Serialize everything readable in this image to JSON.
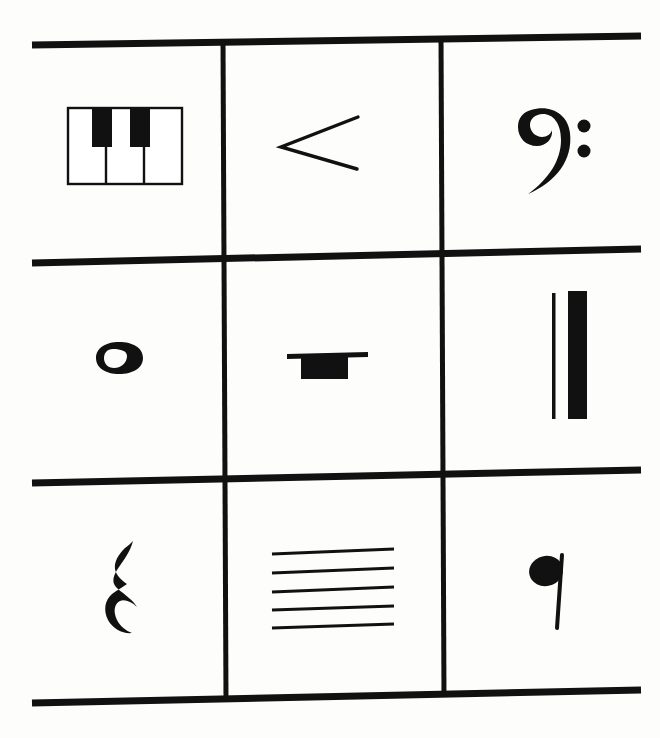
{
  "page": {
    "background_color": "#fdfdfb",
    "ink_color": "#111111",
    "width": 660,
    "height": 738
  },
  "grid": {
    "rows": 3,
    "columns": 3,
    "line_color": "#111111",
    "horizontal_rules": [
      {
        "name": "top-rule",
        "x1": 32,
        "y1": 45,
        "x2": 641,
        "y2": 36,
        "thickness": 7
      },
      {
        "name": "rule-row1-2",
        "x1": 32,
        "y1": 263,
        "x2": 641,
        "y2": 249,
        "thickness": 7
      },
      {
        "name": "rule-row2-3",
        "x1": 32,
        "y1": 483,
        "x2": 641,
        "y2": 470,
        "thickness": 7
      },
      {
        "name": "bottom-rule",
        "x1": 32,
        "y1": 703,
        "x2": 641,
        "y2": 690,
        "thickness": 7
      }
    ],
    "vertical_rules": [
      {
        "name": "column-divider-left",
        "x1": 223,
        "y1": 41,
        "x2": 226,
        "y2": 700,
        "thickness": 5
      },
      {
        "name": "column-divider-right",
        "x1": 441,
        "y1": 38,
        "x2": 444,
        "y2": 697,
        "thickness": 5
      }
    ]
  },
  "cells": [
    {
      "id": "cell-r1c1",
      "row": 1,
      "column": 1,
      "symbol_name": "piano-keyboard-icon",
      "label": "Piano keyboard",
      "white_keys": 3,
      "black_keys": 2
    },
    {
      "id": "cell-r1c2",
      "row": 1,
      "column": 2,
      "symbol_name": "crescendo-hairpin-icon",
      "label": "Crescendo hairpin",
      "glyph": "<"
    },
    {
      "id": "cell-r1c3",
      "row": 1,
      "column": 3,
      "symbol_name": "bass-clef-icon",
      "label": "Bass clef",
      "glyph": "𝄢"
    },
    {
      "id": "cell-r2c1",
      "row": 2,
      "column": 1,
      "symbol_name": "whole-note-icon",
      "label": "Whole note",
      "glyph": "𝅝"
    },
    {
      "id": "cell-r2c2",
      "row": 2,
      "column": 2,
      "symbol_name": "whole-rest-icon",
      "label": "Whole rest",
      "glyph": "𝄻"
    },
    {
      "id": "cell-r2c3",
      "row": 2,
      "column": 3,
      "symbol_name": "final-barline-icon",
      "label": "Final barline",
      "glyph": "𝄂"
    },
    {
      "id": "cell-r3c1",
      "row": 3,
      "column": 1,
      "symbol_name": "quarter-rest-icon",
      "label": "Quarter rest",
      "glyph": "𝄽"
    },
    {
      "id": "cell-r3c2",
      "row": 3,
      "column": 2,
      "symbol_name": "staff-five-lines-icon",
      "label": "Staff",
      "lines": 5
    },
    {
      "id": "cell-r3c3",
      "row": 3,
      "column": 3,
      "symbol_name": "quarter-note-icon",
      "label": "Quarter note",
      "glyph": "𝅘𝅥"
    }
  ]
}
